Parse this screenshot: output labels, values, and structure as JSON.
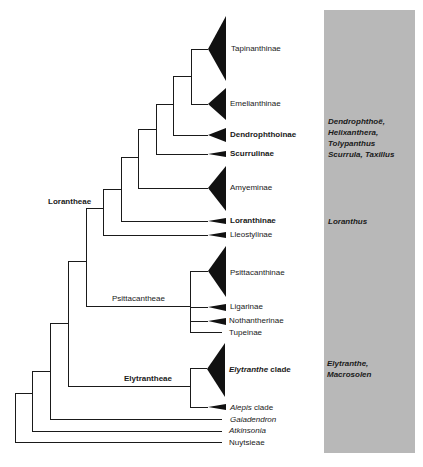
{
  "figure": {
    "type": "phylogenetic-tree",
    "caption_partial": "图 ... (caption cut off at bottom edge)"
  },
  "tribes": {
    "lorantheae": "Lorantheae",
    "psittacantheae": "Psittacantheae",
    "elytrantheae": "Elytrantheae"
  },
  "taxa": [
    {
      "label": "Tapinanthinae",
      "style": "normal",
      "y": 49
    },
    {
      "label": "Emelianthinae",
      "style": "normal",
      "y": 104
    },
    {
      "label": "Dendrophthoinae",
      "style": "bold",
      "y": 135
    },
    {
      "label": "Scurrulinae",
      "style": "bold",
      "y": 154
    },
    {
      "label": "Amyeminae",
      "style": "normal",
      "y": 188
    },
    {
      "label": "Loranthinae",
      "style": "bold",
      "y": 221
    },
    {
      "label": "Lleostylinae",
      "style": "normal",
      "y": 235
    },
    {
      "label": "Psittacanthinae",
      "style": "normal",
      "y": 273
    },
    {
      "label": "Ligarinae",
      "style": "normal",
      "y": 307
    },
    {
      "label": "Nothantherinae",
      "style": "normal",
      "y": 321
    },
    {
      "label": "Tupeinae",
      "style": "normal",
      "y": 333
    },
    {
      "label_italic": "Elytranthe",
      "label_rest": " clade",
      "style": "bold",
      "y": 370
    },
    {
      "label_italic": "Alepis",
      "label_rest": " clade",
      "style": "normal",
      "y": 408
    },
    {
      "label": "Gaiadendron",
      "style": "italic",
      "y": 420
    },
    {
      "label": "Atkinsonia",
      "style": "italic",
      "y": 431
    },
    {
      "label": "Nuytsieae",
      "style": "normal",
      "y": 443
    }
  ],
  "genera_panel": {
    "background": "#b8b8b8",
    "groups": [
      {
        "lines": [
          "Dendrophthoë,",
          "Helixanthera,",
          "Tolypanthus",
          "Scurrula, Taxillus"
        ]
      },
      {
        "lines": [
          "Loranthus"
        ]
      },
      {
        "lines": [
          "Elytranthe,",
          "Macrosolen"
        ]
      }
    ]
  }
}
